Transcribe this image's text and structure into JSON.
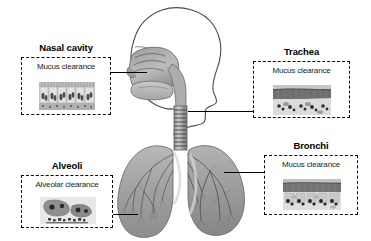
{
  "figure": {
    "background_color": "#ffffff",
    "line_color": "#000000"
  },
  "callouts": [
    {
      "id": "nasal-cavity",
      "title": "Nasal cavity",
      "mechanism": "Mucus clearance",
      "micrograph": "ciliated-pseudostratified-epithelium",
      "position": "top-left"
    },
    {
      "id": "trachea",
      "title": "Trachea",
      "mechanism": "Mucus clearance",
      "micrograph": "tracheal-epithelium-section",
      "position": "top-right"
    },
    {
      "id": "alveoli",
      "title": "Alveoli",
      "mechanism": "Alveolar clearance",
      "micrograph": "alveolar-macrophage",
      "position": "bottom-left"
    },
    {
      "id": "bronchi",
      "title": "Bronchi",
      "mechanism": "Mucus clearance",
      "micrograph": "bronchial-epithelium-section",
      "position": "bottom-right"
    }
  ],
  "anatomy": {
    "head_label": "head-sagittal-profile",
    "nasal_label": "nasal-cavity-structure",
    "trachea_label": "trachea",
    "lungs_label": "lungs-with-bronchial-tree"
  }
}
